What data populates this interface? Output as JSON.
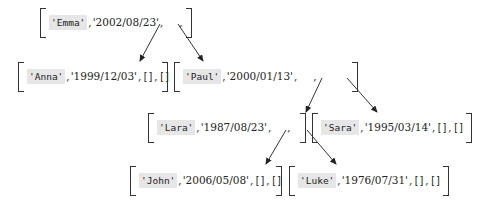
{
  "diagram": {
    "type": "binary-tree",
    "nodes": [
      {
        "id": "emma",
        "name": "'Emma'",
        "date": "'2002/08/23'",
        "left": "pointer",
        "right": "pointer"
      },
      {
        "id": "anna",
        "name": "'Anna'",
        "date": "'1999/12/03'",
        "left": "[]",
        "right": "[]"
      },
      {
        "id": "paul",
        "name": "'Paul'",
        "date": "'2000/01/13'",
        "left": "pointer",
        "right": "pointer"
      },
      {
        "id": "lara",
        "name": "'Lara'",
        "date": "'1987/08/23'",
        "left": "pointer",
        "right": "pointer"
      },
      {
        "id": "sara",
        "name": "'Sara'",
        "date": "'1995/03/14'",
        "left": "[]",
        "right": "[]"
      },
      {
        "id": "john",
        "name": "'John'",
        "date": "'2006/05/08'",
        "left": "[]",
        "right": "[]"
      },
      {
        "id": "luke",
        "name": "'Luke'",
        "date": "'1976/07/31'",
        "left": "[]",
        "right": "[]"
      }
    ],
    "edges": [
      {
        "from": "emma",
        "to": "anna",
        "side": "left"
      },
      {
        "from": "emma",
        "to": "paul",
        "side": "right"
      },
      {
        "from": "paul",
        "to": "lara",
        "side": "left"
      },
      {
        "from": "paul",
        "to": "sara",
        "side": "right"
      },
      {
        "from": "lara",
        "to": "john",
        "side": "left"
      },
      {
        "from": "lara",
        "to": "luke",
        "side": "right"
      }
    ],
    "separator": ",",
    "empty": "[]"
  }
}
